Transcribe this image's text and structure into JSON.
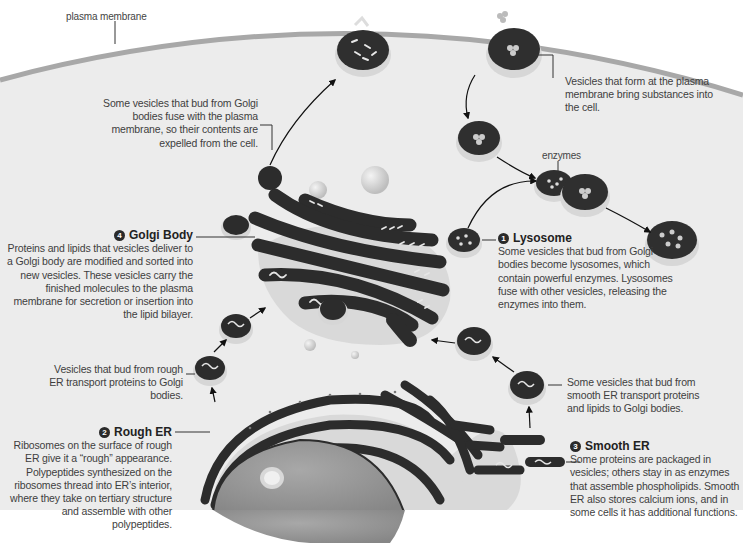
{
  "diagram": {
    "theme_colors": {
      "background": "#ffffff",
      "cytoplasm": "#ebebeb",
      "membrane": "#a9a9a9",
      "vesicle_lumen": "#2e2e2e",
      "vesicle_rim": "#d6d6d6",
      "text": "#3e3e3e"
    },
    "labels": {
      "plasma_membrane": "plasma membrane",
      "exocytosis": "Some vesicles that bud from Golgi bodies fuse with the plasma membrane, so their contents are expelled from the cell.",
      "endocytosis": "Vesicles that form at the plasma membrane bring substances into the cell.",
      "enzymes": "enzymes",
      "golgi": {
        "number": "4",
        "title": "Golgi Body",
        "text": "Proteins and lipids that vesicles deliver to a Golgi body are modified and sorted into new vesicles. These vesicles carry the finished molecules to the plasma membrane for secretion or insertion into the lipid bilayer."
      },
      "lysosome": {
        "number": "1",
        "title": "Lysosome",
        "text": "Some vesicles that bud from Golgi bodies become lysosomes, which contain powerful enzymes. Lysosomes fuse with other vesicles, releasing the enzymes into them."
      },
      "rough_er_vesicles": "Vesicles that bud from rough ER transport proteins to Golgi bodies.",
      "smooth_er_vesicles": "Some vesicles that bud from smooth ER transport proteins and lipids to Golgi bodies.",
      "rough_er": {
        "number": "2",
        "title": "Rough ER",
        "text": "Ribosomes on the surface of rough ER give it a “rough” appearance. Polypeptides synthesized on the ribosomes thread into ER’s interior, where they take on tertiary structure and assemble with other polypeptides."
      },
      "smooth_er": {
        "number": "3",
        "title": "Smooth ER",
        "text": "Some proteins are packaged in vesicles; others stay in as enzymes that assemble phospholipids. Smooth ER also stores calcium ions, and in some cells it has additional functions."
      }
    }
  }
}
